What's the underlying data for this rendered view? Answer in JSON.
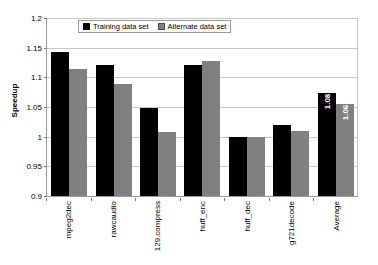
{
  "chart_data": {
    "type": "bar",
    "title": "",
    "xlabel": "",
    "ylabel": "Speedup",
    "ylim": [
      0.9,
      1.2
    ],
    "yticks": [
      "0.9",
      "0.95",
      "1",
      "1.05",
      "1.1",
      "1.15",
      "1.2"
    ],
    "ytick_values": [
      0.9,
      0.95,
      1.0,
      1.05,
      1.1,
      1.15,
      1.2
    ],
    "grid": true,
    "legend_position": "top-center",
    "categories": [
      "mpeg2dec",
      "rawcaudio",
      "129.compress",
      "huff_enc",
      "huff_dec",
      "g721decode",
      "Average"
    ],
    "series": [
      {
        "name": "Training data set",
        "color": "#000000",
        "values": [
          1.142,
          1.12,
          1.049,
          1.121,
          1.0,
          1.02,
          1.073
        ],
        "data_labels": [
          "",
          "",
          "",
          "",
          "",
          "",
          "1.08"
        ]
      },
      {
        "name": "Alternate data set",
        "color": "#808080",
        "values": [
          1.114,
          1.088,
          1.008,
          1.128,
          0.999,
          1.01,
          1.055
        ],
        "data_labels": [
          "",
          "",
          "",
          "",
          "",
          "",
          "1.06"
        ]
      }
    ]
  },
  "legend": {
    "items": [
      {
        "label": "Training data set",
        "swatch": "dark"
      },
      {
        "label": "Alternate data set",
        "swatch": "gray"
      }
    ]
  }
}
